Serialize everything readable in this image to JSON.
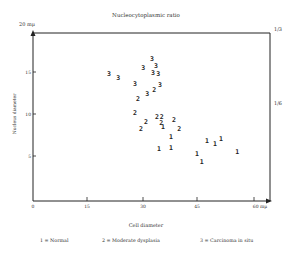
{
  "chart_data": {
    "type": "scatter",
    "title": "Nucleocytoplasmic ratio",
    "xlabel": "Cell diameter",
    "ylabel": "Nucleus diameter",
    "x_unit": "mμ",
    "y_unit": "mμ",
    "xlim": [
      0,
      60
    ],
    "ylim": [
      0,
      20
    ],
    "x_ticks": [
      "0",
      "15",
      "30",
      "45",
      "60 mμ"
    ],
    "y_ticks": [
      "5",
      "10",
      "15",
      "20 mμ"
    ],
    "right_axis_labels": [
      "1/3",
      "1/6"
    ],
    "grid": false,
    "legend": [
      {
        "symbol": "1",
        "label": "1 = Normal"
      },
      {
        "symbol": "2",
        "label": "2 = Moderate dysplasia"
      },
      {
        "symbol": "3",
        "label": "3 = Carcinoma in situ"
      }
    ],
    "series": [
      {
        "name": "Normal",
        "symbol": "1",
        "points": [
          [
            35.4,
            8.7
          ],
          [
            37.6,
            7.6
          ],
          [
            34.3,
            6.1
          ],
          [
            37.6,
            6.3
          ],
          [
            47.4,
            7.1
          ],
          [
            49.6,
            6.7
          ],
          [
            51.2,
            7.3
          ],
          [
            44.7,
            5.5
          ],
          [
            46.0,
            4.6
          ],
          [
            55.6,
            5.8
          ]
        ]
      },
      {
        "name": "Moderate dysplasia",
        "symbol": "2",
        "points": [
          [
            33.0,
            13.2
          ],
          [
            28.6,
            12.1
          ],
          [
            27.8,
            10.4
          ],
          [
            30.8,
            9.4
          ],
          [
            33.8,
            10.0
          ],
          [
            35.1,
            10.0
          ],
          [
            34.9,
            9.2
          ],
          [
            38.4,
            9.6
          ],
          [
            29.4,
            8.5
          ],
          [
            39.8,
            8.5
          ]
        ]
      },
      {
        "name": "Carcinoma in situ",
        "symbol": "3",
        "points": [
          [
            20.7,
            15.1
          ],
          [
            23.2,
            14.6
          ],
          [
            32.4,
            16.8
          ],
          [
            30.0,
            15.8
          ],
          [
            33.5,
            16.0
          ],
          [
            32.7,
            15.2
          ],
          [
            34.1,
            15.1
          ],
          [
            27.8,
            13.9
          ],
          [
            31.1,
            12.7
          ],
          [
            34.6,
            13.8
          ]
        ]
      }
    ]
  },
  "labels": {
    "title": "Nucleocytoplasmic ratio",
    "xlabel": "Cell diameter",
    "ylabel": "Nucleus diameter",
    "y_top": "20 mμ",
    "x_end": "60 mμ",
    "right_top": "1/3",
    "right_mid": "1/6",
    "legend_1": "1 = Normal",
    "legend_2": "2 = Moderate dysplasia",
    "legend_3": "3 = Carcinoma in situ"
  }
}
